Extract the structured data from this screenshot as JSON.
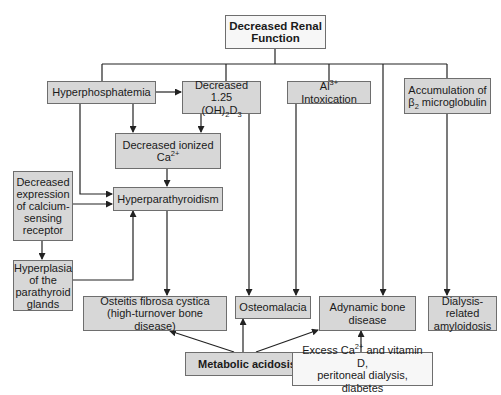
{
  "diagram": {
    "title": "Decreased Renal Function",
    "nodes": {
      "renal": {
        "lines": [
          "Decreased Renal",
          "Function"
        ]
      },
      "hyperphos": {
        "lines": [
          "Hyperphosphatemia"
        ]
      },
      "vitd": {
        "line1": "Decreased 1.25",
        "line2_pre": "(OH)",
        "line2_sub1": "2",
        "line2_mid": "D",
        "line2_sub2": "3"
      },
      "al": {
        "pre": "Al",
        "sup": "3+",
        "post": " Intoxication"
      },
      "b2m": {
        "line1": "Accumulation of",
        "line2_pre": "β",
        "line2_sub": "2",
        "line2_post": " microglobulin"
      },
      "ionca": {
        "line1": "Decreased ionized",
        "line2_pre": "Ca",
        "line2_sup": "2+"
      },
      "casr": {
        "lines": [
          "Decreased",
          "expression",
          "of calcium-",
          "sensing",
          "receptor"
        ]
      },
      "hpt": {
        "lines": [
          "Hyperparathyroidism"
        ]
      },
      "hyperplasia": {
        "lines": [
          "Hyperplasia",
          "of the",
          "parathyroid",
          "glands"
        ]
      },
      "ofc": {
        "lines": [
          "Osteitis fibrosa cystica",
          "(high-turnover bone disease)"
        ]
      },
      "osteomalacia": {
        "lines": [
          "Osteomalacia"
        ]
      },
      "adynamic": {
        "lines": [
          "Adynamic bone",
          "disease"
        ]
      },
      "amyloid": {
        "lines": [
          "Dialysis-related",
          "amyloidosis"
        ]
      },
      "acidosis": {
        "lines": [
          "Metabolic acidosis"
        ]
      },
      "excess": {
        "line1_pre": "Excess Ca",
        "line1_sup": "2+",
        "line1_post": " and vitamin D,",
        "line2": "peritoneal dialysis, diabetes"
      }
    },
    "edges": [
      {
        "from": "renal",
        "to": "hyperphos"
      },
      {
        "from": "renal",
        "to": "vitd"
      },
      {
        "from": "renal",
        "to": "al"
      },
      {
        "from": "renal",
        "to": "adynamic"
      },
      {
        "from": "renal",
        "to": "b2m"
      },
      {
        "from": "hyperphos",
        "to": "vitd"
      },
      {
        "from": "hyperphos",
        "to": "ionca"
      },
      {
        "from": "hyperphos",
        "to": "hpt"
      },
      {
        "from": "vitd",
        "to": "ionca"
      },
      {
        "from": "vitd",
        "to": "osteomalacia"
      },
      {
        "from": "ionca",
        "to": "hpt"
      },
      {
        "from": "casr",
        "to": "hpt"
      },
      {
        "from": "casr",
        "to": "hyperplasia"
      },
      {
        "from": "hyperplasia",
        "to": "hpt"
      },
      {
        "from": "hpt",
        "to": "ofc"
      },
      {
        "from": "al",
        "to": "osteomalacia"
      },
      {
        "from": "b2m",
        "to": "amyloid"
      },
      {
        "from": "acidosis",
        "to": "ofc"
      },
      {
        "from": "acidosis",
        "to": "osteomalacia"
      },
      {
        "from": "acidosis",
        "to": "adynamic"
      },
      {
        "from": "excess",
        "to": "adynamic"
      }
    ],
    "colors": {
      "box_fill": "#d7d7d7",
      "box_fill_light": "#f7f7f7",
      "border": "#6e6e6e",
      "line": "#222222"
    }
  }
}
